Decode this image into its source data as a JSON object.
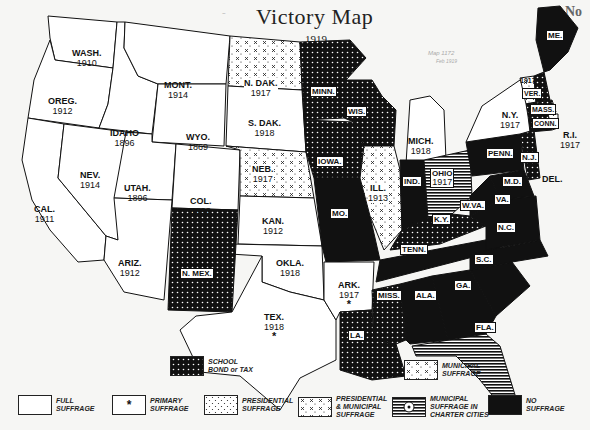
{
  "header": {
    "title": "Victory Map",
    "year": "1919",
    "corner_mark": "No",
    "handwritten_notes": [
      "Map 1172",
      "Feb 1919"
    ]
  },
  "colors": {
    "full": "#ffffff",
    "none": "#111111",
    "line": "#111111",
    "paper": "#f6f6f4"
  },
  "states": {
    "wash": {
      "abbr": "WASH.",
      "year": "1910",
      "category": "full_suffrage"
    },
    "oreg": {
      "abbr": "OREG.",
      "year": "1912",
      "category": "full_suffrage"
    },
    "cal": {
      "abbr": "CAL.",
      "year": "1911",
      "category": "full_suffrage"
    },
    "idaho": {
      "abbr": "IDAHO",
      "year": "1896",
      "category": "full_suffrage"
    },
    "nev": {
      "abbr": "NEV.",
      "year": "1914",
      "category": "full_suffrage"
    },
    "mont": {
      "abbr": "MONT.",
      "year": "1914",
      "category": "full_suffrage"
    },
    "wyo": {
      "abbr": "WYO.",
      "year": "1869",
      "category": "full_suffrage"
    },
    "utah": {
      "abbr": "UTAH.",
      "year": "1896",
      "category": "full_suffrage"
    },
    "col": {
      "abbr": "COL.",
      "year": "1893",
      "category": "full_suffrage"
    },
    "ariz": {
      "abbr": "ARIZ.",
      "year": "1912",
      "category": "full_suffrage"
    },
    "ndak": {
      "abbr": "N. DAK.",
      "year": "1917",
      "category": "presidential_municipal"
    },
    "sdak": {
      "abbr": "S. DAK.",
      "year": "1918",
      "category": "full_suffrage"
    },
    "neb": {
      "abbr": "NEB.",
      "year": "1917",
      "category": "presidential_municipal"
    },
    "kan": {
      "abbr": "KAN.",
      "year": "1912",
      "category": "full_suffrage"
    },
    "okla": {
      "abbr": "OKLA.",
      "year": "1918",
      "category": "full_suffrage"
    },
    "tex": {
      "abbr": "TEX.",
      "year": "1918",
      "category": "primary_suffrage",
      "mark": "*"
    },
    "nmex": {
      "abbr": "N. MEX.",
      "category": "school_bond_tax"
    },
    "minn": {
      "abbr": "MINN.",
      "category": "school_bond_tax"
    },
    "iowa": {
      "abbr": "IOWA.",
      "category": "school_bond_tax"
    },
    "mo": {
      "abbr": "MO.",
      "category": "no_suffrage"
    },
    "ark": {
      "abbr": "ARK.",
      "year": "1917",
      "category": "primary_suffrage",
      "mark": "*"
    },
    "la": {
      "abbr": "LA.",
      "category": "school_bond_tax"
    },
    "wis": {
      "abbr": "WIS.",
      "category": "school_bond_tax"
    },
    "ill": {
      "abbr": "ILL.",
      "year": "1913",
      "category": "presidential_municipal"
    },
    "mich": {
      "abbr": "MICH.",
      "year": "1918",
      "category": "full_suffrage"
    },
    "ind": {
      "abbr": "IND.",
      "category": "no_suffrage"
    },
    "ohio": {
      "abbr": "OHIO",
      "year": "1917",
      "category": "municipal_charter_cities"
    },
    "ky": {
      "abbr": "K.Y.",
      "category": "school_bond_tax"
    },
    "tenn": {
      "abbr": "TENN.",
      "category": "no_suffrage"
    },
    "miss": {
      "abbr": "MISS.",
      "category": "school_bond_tax"
    },
    "ala": {
      "abbr": "ALA.",
      "category": "no_suffrage"
    },
    "ga": {
      "abbr": "GA.",
      "category": "no_suffrage"
    },
    "fla": {
      "abbr": "FLA.",
      "category": "municipal_charter_cities"
    },
    "sc": {
      "abbr": "S.C.",
      "category": "no_suffrage"
    },
    "nc": {
      "abbr": "N.C.",
      "category": "no_suffrage"
    },
    "va": {
      "abbr": "VA.",
      "category": "no_suffrage"
    },
    "wva": {
      "abbr": "W.VA.",
      "category": "no_suffrage"
    },
    "md": {
      "abbr": "M.D.",
      "category": "no_suffrage"
    },
    "del": {
      "abbr": "DEL.",
      "category": "school_bond_tax"
    },
    "nj": {
      "abbr": "N.J.",
      "category": "school_bond_tax"
    },
    "penn": {
      "abbr": "PENN.",
      "category": "no_suffrage"
    },
    "ny": {
      "abbr": "N.Y.",
      "year": "1917",
      "category": "full_suffrage"
    },
    "vt": {
      "abbr": "VER.",
      "year": "1917",
      "category": "presidential_municipal"
    },
    "nh": {
      "abbr": "N.H.",
      "category": "school_bond_tax"
    },
    "mass": {
      "abbr": "MASS.",
      "category": "school_bond_tax"
    },
    "conn": {
      "abbr": "CONN.",
      "category": "school_bond_tax"
    },
    "ri": {
      "abbr": "R.I.",
      "year": "1917",
      "category": "presidential_suffrage"
    },
    "me": {
      "abbr": "ME.",
      "category": "no_suffrage"
    }
  },
  "legend": {
    "full": "FULL SUFFRAGE",
    "full_l1": "FULL",
    "full_l2": "SUFFRAGE",
    "primary_l1": "PRIMARY",
    "primary_l2": "SUFFRAGE",
    "primary_mark": "*",
    "presidential_l1": "PRESIDENTIAL",
    "presidential_l2": "SUFFRAGE",
    "pres_muni_l1": "PRESIDENTIAL",
    "pres_muni_l2": "& MUNICIPAL",
    "pres_muni_l3": "SUFFRAGE",
    "charter_l1": "MUNICIPAL",
    "charter_l2": "SUFFRAGE IN",
    "charter_l3": "CHARTER CITIES",
    "none_l1": "NO",
    "none_l2": "SUFFRAGE",
    "school_l1": "SCHOOL",
    "school_l2": "BOND or TAX",
    "municipal_l1": "MUNICIPAL",
    "municipal_l2": "SUFFRAGE"
  }
}
